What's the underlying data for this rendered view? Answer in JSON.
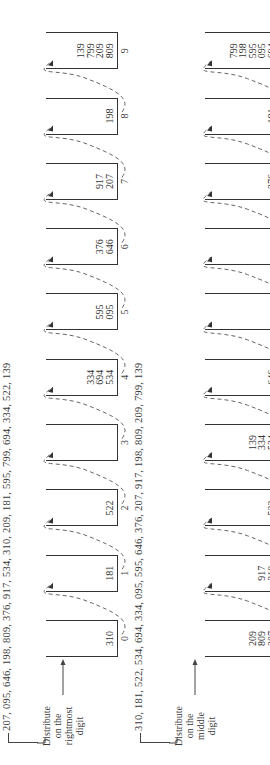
{
  "figure": {
    "orientation": "rotated-90-ccw",
    "panels": [
      {
        "id": "pass1",
        "input_sequence": "207, 095, 646, 198, 809, 376, 917, 534, 310, 209, 181, 595, 799, 694, 334, 522, 139",
        "instruction": [
          "Distribute",
          "on the",
          "rightmost",
          "digit"
        ],
        "buckets": [
          {
            "label": "0",
            "values": [
              "310"
            ]
          },
          {
            "label": "1",
            "values": [
              "181"
            ]
          },
          {
            "label": "2",
            "values": [
              "522"
            ]
          },
          {
            "label": "3",
            "values": []
          },
          {
            "label": "4",
            "values": [
              "534",
              "694",
              "334"
            ]
          },
          {
            "label": "5",
            "values": [
              "095",
              "595"
            ]
          },
          {
            "label": "6",
            "values": [
              "646",
              "376"
            ]
          },
          {
            "label": "7",
            "values": [
              "207",
              "917"
            ]
          },
          {
            "label": "8",
            "values": [
              "198"
            ]
          },
          {
            "label": "9",
            "values": [
              "809",
              "209",
              "799",
              "139"
            ]
          }
        ]
      },
      {
        "id": "pass2",
        "input_sequence": "310, 181, 522, 534, 694, 334, 095, 595, 646, 376, 207, 917, 198, 809, 209, 799, 139",
        "instruction": [
          "Distribute",
          "on the",
          "middle",
          "digit"
        ],
        "buckets": [
          {
            "label": "0",
            "values": [
              "207",
              "809",
              "209"
            ]
          },
          {
            "label": "1",
            "values": [
              "310",
              "917"
            ]
          },
          {
            "label": "2",
            "values": [
              "522"
            ]
          },
          {
            "label": "3",
            "values": [
              "534",
              "334",
              "139"
            ]
          },
          {
            "label": "4",
            "values": [
              "646"
            ]
          },
          {
            "label": "5",
            "values": []
          },
          {
            "label": "6",
            "values": []
          },
          {
            "label": "7",
            "values": [
              "376"
            ]
          },
          {
            "label": "8",
            "values": [
              "181"
            ]
          },
          {
            "label": "9",
            "values": [
              "694",
              "095",
              "595",
              "198",
              "799"
            ]
          }
        ]
      }
    ]
  },
  "layout": {
    "bucket_x0": 108,
    "bucket_spacing": 65.3,
    "box_width": 37,
    "panels": [
      {
        "seq_top": 1,
        "seq_left": 34,
        "line_x": 22,
        "instr_left": 12,
        "instr_top": 72,
        "box_top": 46,
        "box_height": 72,
        "label_top": 119
      },
      {
        "seq_top": 133,
        "seq_left": 34,
        "line_x": 22,
        "instr_left": 12,
        "instr_top": 200,
        "box_top": 205,
        "box_height": 75,
        "label_top": 285
      }
    ]
  }
}
